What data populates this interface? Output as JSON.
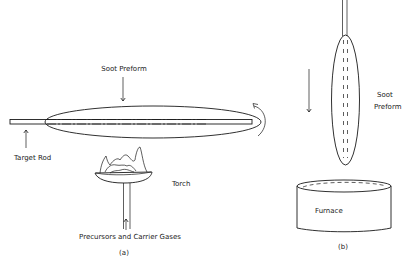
{
  "figure": {
    "panel_a": {
      "caption": "(a)",
      "labels": {
        "soot_preform": "Soot Preform",
        "target_rod": "Target Rod",
        "torch": "Torch",
        "precursors": "Precursors and Carrier Gases"
      }
    },
    "panel_b": {
      "caption": "(b)",
      "labels": {
        "soot_preform_line1": "Soot",
        "soot_preform_line2": "Preform",
        "furnace": "Furnace"
      }
    },
    "colors": {
      "ink": "#1a1a1a",
      "background": "#ffffff"
    }
  }
}
